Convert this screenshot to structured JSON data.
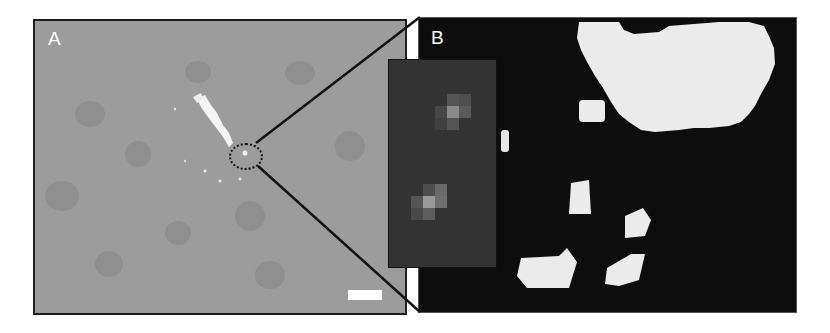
{
  "figure": {
    "panels": [
      {
        "id": "A",
        "label": "A",
        "description": "Grayscale micrograph with bright white feature and dotted circle marking region of interest",
        "background_color": "#9c9c9c",
        "has_scale_bar": true,
        "scale_bar_color": "#ffffff"
      },
      {
        "id": "B",
        "label": "B",
        "description": "Magnified binary-like view showing white blobs on black background",
        "background_color": "#0d0d0d",
        "blob_color": "#ececec"
      }
    ],
    "inset": {
      "description": "Zoomed inset showing two small pixel clusters",
      "background_color": "#333333",
      "clusters": 2
    },
    "zoom_lines_color": "#111111"
  }
}
